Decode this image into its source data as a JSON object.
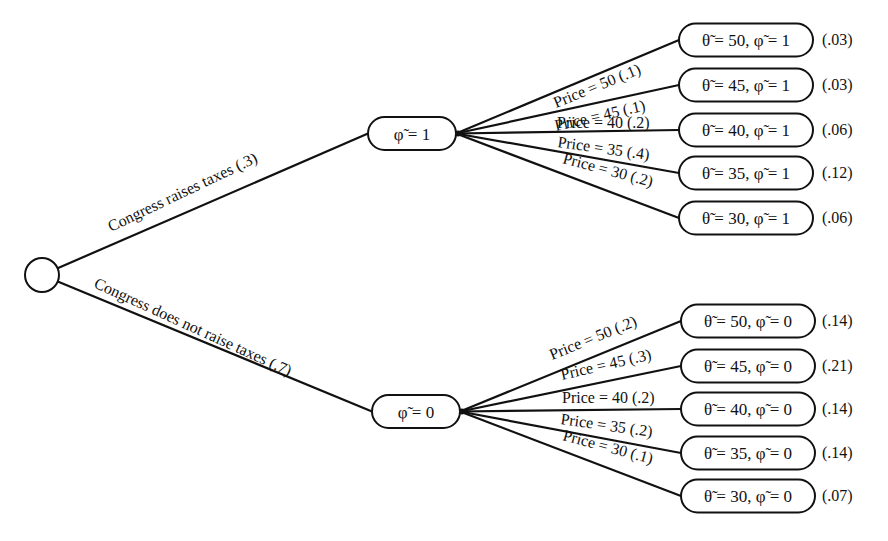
{
  "root": {
    "label": "",
    "cx": 42,
    "cy": 275,
    "r": 17
  },
  "first_branches": [
    {
      "edge_label": "Congress raises taxes (.3)",
      "probability": 0.3,
      "node": {
        "label": "φ̃ = 1",
        "phi": 1,
        "x": 368,
        "y": 117,
        "w": 88,
        "h": 33
      },
      "label_pos": {
        "x": 111,
        "y": 232,
        "angle": -25.5
      }
    },
    {
      "edge_label": "Congress does not raise taxes (.7)",
      "probability": 0.7,
      "node": {
        "label": "φ̃ = 0",
        "phi": 0,
        "x": 372,
        "y": 395,
        "w": 88,
        "h": 33
      },
      "label_pos": {
        "x": 93,
        "y": 287,
        "angle": 24.5
      }
    }
  ],
  "price_branches": {
    "phi_1": [
      {
        "edge_label": "Price = 50 (.1)",
        "price": 50,
        "probability": 0.1,
        "leaf": "θ̃ = 50, φ̃ = 1",
        "joint": "(.03)",
        "cy": 40,
        "label_pos": {
          "x": 556,
          "y": 108,
          "angle": -22
        }
      },
      {
        "edge_label": "Price = 45 (.1)",
        "price": 45,
        "probability": 0.1,
        "leaf": "θ̃ = 45, φ̃ = 1",
        "joint": "(.03)",
        "cy": 85,
        "label_pos": {
          "x": 556,
          "y": 131,
          "angle": -13
        }
      },
      {
        "edge_label": "Price = 40 (.2)",
        "price": 40,
        "probability": 0.2,
        "leaf": "θ̃ = 40, φ̃ = 1",
        "joint": "(.06)",
        "cy": 130,
        "label_pos": {
          "x": 557,
          "y": 128,
          "angle": 0
        }
      },
      {
        "edge_label": "Price = 35 (.4)",
        "price": 35,
        "probability": 0.4,
        "leaf": "θ̃ = 35, φ̃ = 1",
        "joint": "(.12)",
        "cy": 173,
        "label_pos": {
          "x": 557,
          "y": 147,
          "angle": 8
        }
      },
      {
        "edge_label": "Price = 30 (.2)",
        "price": 30,
        "probability": 0.2,
        "leaf": "θ̃ = 30, φ̃ = 1",
        "joint": "(.06)",
        "cy": 218,
        "label_pos": {
          "x": 562,
          "y": 163,
          "angle": 15
        }
      }
    ],
    "phi_0": [
      {
        "edge_label": "Price = 50  (.2)",
        "price": 50,
        "probability": 0.2,
        "leaf": "θ̃ = 50, φ̃ = 0",
        "joint": "(.14)",
        "cy": 321,
        "label_pos": {
          "x": 552,
          "y": 360,
          "angle": -22
        }
      },
      {
        "edge_label": "Price = 45 (.3)",
        "price": 45,
        "probability": 0.3,
        "leaf": "θ̃ = 45, φ̃ = 0",
        "joint": "(.21)",
        "cy": 366,
        "label_pos": {
          "x": 562,
          "y": 380,
          "angle": -13
        }
      },
      {
        "edge_label": "Price = 40 (.2)",
        "price": 40,
        "probability": 0.2,
        "leaf": "θ̃ = 40, φ̃ = 0",
        "joint": "(.14)",
        "cy": 409,
        "label_pos": {
          "x": 562,
          "y": 403,
          "angle": 0
        }
      },
      {
        "edge_label": "Price = 35  (.2)",
        "price": 35,
        "probability": 0.2,
        "leaf": "θ̃ = 35, φ̃ = 0",
        "joint": "(.14)",
        "cy": 453,
        "label_pos": {
          "x": 560,
          "y": 424,
          "angle": 8
        }
      },
      {
        "edge_label": "Price = 30  (.1)",
        "price": 30,
        "probability": 0.1,
        "leaf": "θ̃ = 30, φ̃ = 0",
        "joint": "(.07)",
        "cy": 496,
        "label_pos": {
          "x": 562,
          "y": 440,
          "angle": 15
        }
      }
    ]
  },
  "leaf_box": {
    "x_top": 679,
    "x_bottom": 681,
    "w": 134,
    "h": 33,
    "prob_x": 822
  },
  "colors": {
    "stroke": "#111111",
    "background": "#ffffff",
    "text": "#111111"
  }
}
